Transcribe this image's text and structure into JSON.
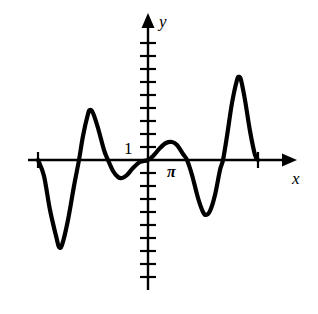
{
  "figure": {
    "title": "",
    "background_color": "#ffffff",
    "stroke_color": "#000000",
    "width": 318,
    "height": 314
  },
  "labels": {
    "y_axis": "y",
    "x_axis": "x",
    "y_tick_one": "1",
    "x_tick_pi": "π"
  },
  "chart_data": {
    "type": "line",
    "title": "",
    "xlabel": "x",
    "ylabel": "y",
    "grid": false,
    "legend": null,
    "annotations": [
      {
        "text": "1",
        "axis": "y",
        "value": 1
      },
      {
        "text": "π",
        "axis": "x",
        "value": 3.14159
      }
    ],
    "axes": {
      "x_axis_pixel_y": 160,
      "y_axis_pixel_x": 148,
      "x_axis_pixel_range": [
        28,
        288
      ],
      "y_axis_pixel_range": [
        22,
        290
      ],
      "x_tick_pixels": [
        38,
        258
      ],
      "y_tick_pixel_spacing": 13,
      "y_tick_pixels_up": [
        147,
        134,
        121,
        108,
        95,
        82,
        69,
        56,
        43
      ],
      "y_tick_pixels_down": [
        173,
        186,
        199,
        212,
        225,
        238,
        251,
        264,
        277
      ],
      "unit_pixels_per_y": 13
    },
    "series": [
      {
        "name": "f(x)",
        "stroke_color": "#000000",
        "stroke_width": 4.2,
        "description": "Damped-looking oscillating wave of increasing amplitude toward the right, drawn between the two x-axis tick marks",
        "points_pixel": [
          [
            38,
            160
          ],
          [
            44,
            176
          ],
          [
            50,
            210
          ],
          [
            57,
            240
          ],
          [
            59,
            247
          ],
          [
            62,
            245
          ],
          [
            68,
            220
          ],
          [
            74,
            186
          ],
          [
            79,
            160
          ],
          [
            83,
            136
          ],
          [
            88,
            114
          ],
          [
            90,
            110
          ],
          [
            93,
            113
          ],
          [
            98,
            128
          ],
          [
            104,
            150
          ],
          [
            108,
            160
          ],
          [
            113,
            171
          ],
          [
            118,
            177
          ],
          [
            122,
            178
          ],
          [
            127,
            175
          ],
          [
            133,
            168
          ],
          [
            140,
            162
          ],
          [
            148,
            160
          ],
          [
            154,
            155
          ],
          [
            160,
            148
          ],
          [
            166,
            143
          ],
          [
            172,
            142
          ],
          [
            177,
            145
          ],
          [
            183,
            154
          ],
          [
            187,
            160
          ],
          [
            192,
            175
          ],
          [
            198,
            198
          ],
          [
            203,
            212
          ],
          [
            206,
            215
          ],
          [
            210,
            211
          ],
          [
            215,
            195
          ],
          [
            220,
            170
          ],
          [
            223,
            160
          ],
          [
            227,
            136
          ],
          [
            232,
            103
          ],
          [
            237,
            80
          ],
          [
            239,
            77
          ],
          [
            241,
            80
          ],
          [
            245,
            100
          ],
          [
            250,
            131
          ],
          [
            255,
            155
          ],
          [
            258,
            160
          ]
        ],
        "x_values_approx": [
          -6.28,
          -5.5,
          -4.71,
          -3.93,
          -3.14,
          -2.36,
          -1.57,
          -0.79,
          0,
          0.79,
          1.57,
          2.36,
          3.14,
          3.93,
          4.71,
          5.5,
          6.28
        ],
        "y_values_approx": [
          0,
          -2.6,
          -6.7,
          -3.6,
          3.8,
          1.9,
          -1.4,
          -0.9,
          0,
          0.75,
          1.4,
          0.6,
          0,
          -2.6,
          -4.2,
          -1.4,
          6.4,
          0
        ]
      }
    ]
  }
}
